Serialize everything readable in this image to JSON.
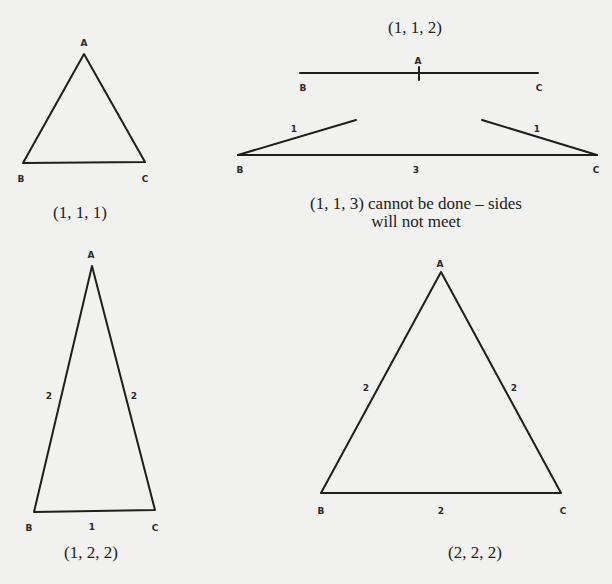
{
  "figures": [
    {
      "id": "eq-1-1-1",
      "caption": "(1, 1, 1)",
      "vertices": {
        "A": "A",
        "B": "B",
        "C": "C"
      },
      "sides": {}
    },
    {
      "id": "degenerate-1-1-2",
      "caption": "(1, 1, 2)",
      "vertices": {
        "A": "A",
        "B": "B",
        "C": "C"
      }
    },
    {
      "id": "impossible-1-1-3",
      "caption_line1": "(1, 1, 3) cannot be done – sides",
      "caption_line2": "will not meet",
      "vertices": {
        "B": "B",
        "C": "C"
      },
      "sides": {
        "left": "1",
        "right": "1",
        "base": "3"
      }
    },
    {
      "id": "iso-1-2-2",
      "caption": "(1, 2, 2)",
      "vertices": {
        "A": "A",
        "B": "B",
        "C": "C"
      },
      "sides": {
        "AB": "2",
        "AC": "2",
        "BC": "1"
      }
    },
    {
      "id": "eq-2-2-2",
      "caption": "(2, 2, 2)",
      "vertices": {
        "A": "A",
        "B": "B",
        "C": "C"
      },
      "sides": {
        "AB": "2",
        "AC": "2",
        "BC": "2"
      }
    }
  ],
  "colors": {
    "background": "#f1f1ef",
    "ink": "#1e1e1e"
  }
}
